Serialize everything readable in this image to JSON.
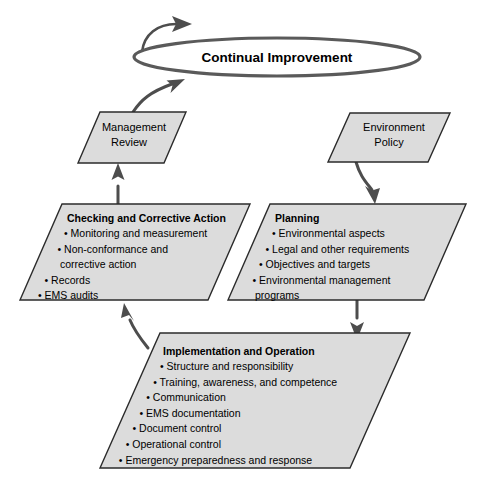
{
  "diagram": {
    "title": "Continual Improvement",
    "cycle": {
      "label": "Continual Improvement"
    },
    "colors": {
      "node_fill": "#dcdcdc",
      "node_stroke": "#2b2b2b",
      "connector": "#4d4d4d",
      "cycle_stroke": "#5a5a5a",
      "background": "#ffffff",
      "text": "#000000"
    },
    "nodes": {
      "management_review": {
        "title_line_1": "Management",
        "title_line_2": "Review"
      },
      "environment_policy": {
        "title_line_1": "Environment",
        "title_line_2": "Policy"
      },
      "checking": {
        "title": "Checking and Corrective Action",
        "bullets": [
          "Monitoring and measurement",
          "Non-conformance and",
          "corrective action",
          "Records",
          "EMS audits"
        ],
        "bullet_flags": [
          true,
          true,
          false,
          true,
          true
        ]
      },
      "planning": {
        "title": "Planning",
        "bullets": [
          "Environmental aspects",
          "Legal and other requirements",
          "Objectives and targets",
          "Environmental management",
          "programs"
        ],
        "bullet_flags": [
          true,
          true,
          true,
          true,
          false
        ]
      },
      "implementation": {
        "title": "Implementation and Operation",
        "bullets": [
          "Structure and responsibility",
          "Training, awareness, and competence",
          "Communication",
          "EMS documentation",
          "Document control",
          "Operational control",
          "Emergency preparedness and response"
        ],
        "bullet_flags": [
          true,
          true,
          true,
          true,
          true,
          true,
          true
        ]
      }
    },
    "bullet_glyph": "•"
  }
}
